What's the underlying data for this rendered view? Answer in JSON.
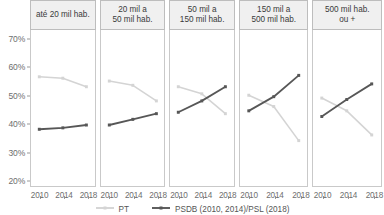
{
  "chart_data": {
    "type": "line",
    "title": "",
    "subtitle": "",
    "xlabel": "",
    "ylabel": "",
    "x": [
      2010,
      2014,
      2018
    ],
    "xtick_labels": [
      "2010",
      "2014",
      "2018"
    ],
    "ylim": [
      18,
      73
    ],
    "ytick_values": [
      20,
      30,
      40,
      50,
      60,
      70
    ],
    "ytick_labels": [
      "20%",
      "30%",
      "40%",
      "50%",
      "60%",
      "70%"
    ],
    "grid": false,
    "legend_position": "bottom",
    "facet_variable": "Porte do município",
    "facets": [
      {
        "label": "até 20 mil hab.",
        "series": [
          {
            "name": "PT",
            "values": [
              56.5,
              56.0,
              53.0
            ]
          },
          {
            "name": "PSDB (2010, 2014)/PSL (2018)",
            "values": [
              38.0,
              38.5,
              39.5
            ]
          }
        ]
      },
      {
        "label": "20 mil a\n50 mil hab.",
        "series": [
          {
            "name": "PT",
            "values": [
              55.0,
              53.5,
              48.0
            ]
          },
          {
            "name": "PSDB (2010, 2014)/PSL (2018)",
            "values": [
              39.5,
              41.5,
              43.5
            ]
          }
        ]
      },
      {
        "label": "50 mil a\n150 mil hab.",
        "series": [
          {
            "name": "PT",
            "values": [
              53.0,
              50.5,
              43.5
            ]
          },
          {
            "name": "PSDB (2010, 2014)/PSL (2018)",
            "values": [
              44.0,
              48.0,
              53.0
            ]
          }
        ]
      },
      {
        "label": "150 mil a\n500 mil hab.",
        "series": [
          {
            "name": "PT",
            "values": [
              50.0,
              46.0,
              34.0
            ]
          },
          {
            "name": "PSDB (2010, 2014)/PSL (2018)",
            "values": [
              44.5,
              49.5,
              57.0
            ]
          }
        ]
      },
      {
        "label": "500 mil hab.\nou +",
        "series": [
          {
            "name": "PT",
            "values": [
              49.0,
              44.5,
              36.0
            ]
          },
          {
            "name": "PSDB (2010, 2014)/PSL (2018)",
            "values": [
              42.5,
              48.5,
              54.0
            ]
          }
        ]
      }
    ],
    "legend": [
      {
        "label": "PT",
        "color": "#d4d4d4"
      },
      {
        "label": "PSDB (2010, 2014)/PSL (2018)",
        "color": "#575757"
      }
    ]
  },
  "colors": {
    "pt_line": "#d4d4d4",
    "psdb_line": "#575757",
    "axis_text": "#6e6e6e",
    "panel_border": "#c9c9c9",
    "header_bg": "#f0f0f0",
    "header_border": "#bdbdbd",
    "background": "#ffffff"
  }
}
